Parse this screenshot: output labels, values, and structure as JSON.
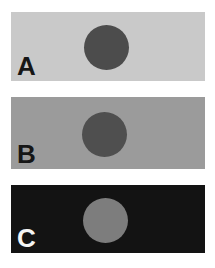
{
  "figure": {
    "description_colors": {
      "page_background": "#ffffff"
    },
    "panels": [
      {
        "label": "A",
        "label_color": "#161616",
        "background": "#c9c9c9",
        "circle_color": "#4c4c4c"
      },
      {
        "label": "B",
        "label_color": "#161616",
        "background": "#9b9b9b",
        "circle_color": "#4f4f4f"
      },
      {
        "label": "C",
        "label_color": "#f4f4f4",
        "background": "#131313",
        "circle_color": "#7d7d7d"
      }
    ]
  }
}
